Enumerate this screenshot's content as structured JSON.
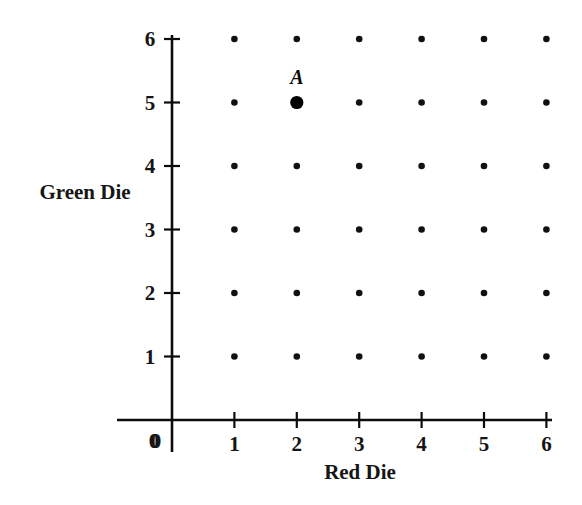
{
  "chart_data": {
    "type": "scatter",
    "title": "",
    "xlabel": "Red Die",
    "ylabel": "Green Die",
    "xticks": [
      "0",
      "1",
      "2",
      "3",
      "4",
      "5",
      "6"
    ],
    "yticks": [
      "0",
      "1",
      "2",
      "3",
      "4",
      "5",
      "6"
    ],
    "xlim": [
      0,
      6
    ],
    "ylim": [
      0,
      6
    ],
    "grid": false,
    "legend": null,
    "series": [
      {
        "name": "sample-space",
        "marker": "small-dot",
        "points": [
          {
            "x": 1,
            "y": 1
          },
          {
            "x": 2,
            "y": 1
          },
          {
            "x": 3,
            "y": 1
          },
          {
            "x": 4,
            "y": 1
          },
          {
            "x": 5,
            "y": 1
          },
          {
            "x": 6,
            "y": 1
          },
          {
            "x": 1,
            "y": 2
          },
          {
            "x": 2,
            "y": 2
          },
          {
            "x": 3,
            "y": 2
          },
          {
            "x": 4,
            "y": 2
          },
          {
            "x": 5,
            "y": 2
          },
          {
            "x": 6,
            "y": 2
          },
          {
            "x": 1,
            "y": 3
          },
          {
            "x": 2,
            "y": 3
          },
          {
            "x": 3,
            "y": 3
          },
          {
            "x": 4,
            "y": 3
          },
          {
            "x": 5,
            "y": 3
          },
          {
            "x": 6,
            "y": 3
          },
          {
            "x": 1,
            "y": 4
          },
          {
            "x": 2,
            "y": 4
          },
          {
            "x": 3,
            "y": 4
          },
          {
            "x": 4,
            "y": 4
          },
          {
            "x": 5,
            "y": 4
          },
          {
            "x": 6,
            "y": 4
          },
          {
            "x": 1,
            "y": 5
          },
          {
            "x": 3,
            "y": 5
          },
          {
            "x": 4,
            "y": 5
          },
          {
            "x": 5,
            "y": 5
          },
          {
            "x": 6,
            "y": 5
          },
          {
            "x": 1,
            "y": 6
          },
          {
            "x": 2,
            "y": 6
          },
          {
            "x": 3,
            "y": 6
          },
          {
            "x": 4,
            "y": 6
          },
          {
            "x": 5,
            "y": 6
          },
          {
            "x": 6,
            "y": 6
          }
        ]
      },
      {
        "name": "highlighted-outcome",
        "marker": "large-dot",
        "points": [
          {
            "x": 2,
            "y": 5,
            "label": "A"
          }
        ]
      }
    ],
    "annotations": [
      {
        "text": "A",
        "x": 2,
        "y": 5,
        "dy": 26
      }
    ],
    "colors": {
      "ink": "#0d0d0d",
      "dot": "#111111",
      "highlight": "#000000",
      "background": "#ffffff"
    }
  },
  "geometry": {
    "origin_x": 172,
    "origin_y": 420,
    "x_step": 62.4,
    "y_step": 63.5,
    "x_axis_left": 117,
    "x_axis_right": 552,
    "y_axis_top": 35,
    "y_axis_bottom": 452,
    "tick_len": 8,
    "dot_radius": 3.3,
    "highlight_radius": 6.6
  }
}
